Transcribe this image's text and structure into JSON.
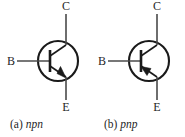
{
  "figure": {
    "background_color": "#ffffff",
    "line_color": "#1a1a1a",
    "panels": [
      {
        "id": "npn",
        "caption_tag": "(a)",
        "caption_type": "npn",
        "symbol": "bipolar-junction-transistor-npn",
        "emitter_arrow_direction": "outward-from-base",
        "terminals": [
          {
            "name": "collector",
            "label": "C",
            "position": "top"
          },
          {
            "name": "base",
            "label": "B",
            "position": "left"
          },
          {
            "name": "emitter",
            "label": "E",
            "position": "bottom"
          }
        ]
      },
      {
        "id": "pnp",
        "caption_tag": "(b)",
        "caption_type": "pnp",
        "symbol": "bipolar-junction-transistor-pnp",
        "emitter_arrow_direction": "inward-toward-base",
        "terminals": [
          {
            "name": "collector",
            "label": "C",
            "position": "top"
          },
          {
            "name": "base",
            "label": "B",
            "position": "left"
          },
          {
            "name": "emitter",
            "label": "E",
            "position": "bottom"
          }
        ]
      }
    ]
  }
}
